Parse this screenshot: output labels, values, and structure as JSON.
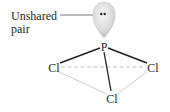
{
  "diagram": {
    "label": {
      "line1": "Unshared",
      "line2": "pair"
    },
    "atoms": {
      "central": "P",
      "left": "Cl",
      "right": "Cl",
      "bottom": "Cl"
    },
    "lone_pair_symbol": "••",
    "colors": {
      "text": "#231f20",
      "bond": "#231f20",
      "back_bond": "#c8c8c8",
      "dashed_edge": "#b4b4b4",
      "lobe_fill_light": "#f4f4f4",
      "lobe_fill_dark": "#bdbdbd"
    }
  }
}
